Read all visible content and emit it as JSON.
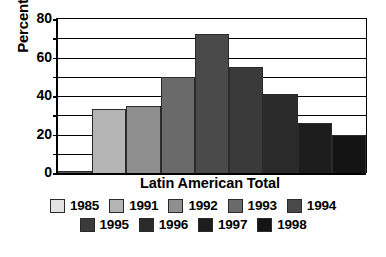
{
  "chart_data": {
    "type": "bar",
    "title": "",
    "xlabel": "Latin American Total",
    "ylabel": "Percent",
    "categories": [
      "1985",
      "1991",
      "1992",
      "1993",
      "1994",
      "1995",
      "1996",
      "1997",
      "1998"
    ],
    "values": [
      1,
      33,
      35,
      50,
      72,
      55,
      41,
      26,
      20
    ],
    "series": [
      {
        "name": "Latin American Total",
        "values": [
          1,
          33,
          35,
          50,
          72,
          55,
          41,
          26,
          20
        ]
      }
    ],
    "ylim": [
      0,
      80
    ],
    "ytick_labels": [
      "0",
      "20",
      "40",
      "60",
      "80"
    ],
    "ytick_values": [
      0,
      20,
      40,
      60,
      80
    ],
    "gridline_values": [
      10,
      20,
      30,
      40,
      50,
      60,
      70,
      80
    ],
    "grid": true,
    "legend_position": "bottom",
    "bar_colors": [
      "#e3e3e3",
      "#b4b4b4",
      "#8f8f8f",
      "#6a6a6a",
      "#4a4a4a",
      "#3a3a3a",
      "#2a2a2a",
      "#1d1d1d",
      "#141414"
    ]
  },
  "axis": {
    "y_title": "Percent",
    "x_title": "Latin American Total",
    "ticks": [
      {
        "label": "80",
        "value": 80
      },
      {
        "label": "60",
        "value": 60
      },
      {
        "label": "40",
        "value": 40
      },
      {
        "label": "20",
        "value": 20
      },
      {
        "label": "0",
        "value": 0
      }
    ]
  },
  "legend": {
    "rows": [
      [
        {
          "label": "1985",
          "color": "#e3e3e3"
        },
        {
          "label": "1991",
          "color": "#b4b4b4"
        },
        {
          "label": "1992",
          "color": "#8f8f8f"
        },
        {
          "label": "1993",
          "color": "#6a6a6a"
        },
        {
          "label": "1994",
          "color": "#4a4a4a"
        }
      ],
      [
        {
          "label": "1995",
          "color": "#3a3a3a"
        },
        {
          "label": "1996",
          "color": "#2a2a2a"
        },
        {
          "label": "1997",
          "color": "#1d1d1d"
        },
        {
          "label": "1998",
          "color": "#141414"
        }
      ]
    ]
  }
}
